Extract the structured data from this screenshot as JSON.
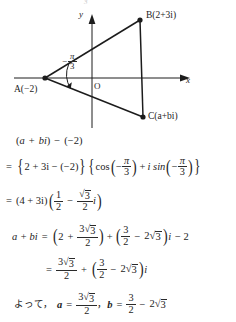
{
  "diagram": {
    "name": "complex-plane-triangle",
    "axes": {
      "x_label": "x",
      "y_label": "y",
      "origin_label": "O"
    },
    "top_artifact": "3",
    "points": [
      {
        "id": "A",
        "label": "A(−2)",
        "value": "−2",
        "x": 45,
        "y": 78
      },
      {
        "id": "B",
        "label": "B(2+3i)",
        "value": "2+3i",
        "x": 140,
        "y": 20
      },
      {
        "id": "C",
        "label": "C(a+bi)",
        "value": "a+bi",
        "x": 143,
        "y": 117
      }
    ],
    "angle": {
      "sign": "−",
      "numerator": "π",
      "denominator": "3",
      "text": "−π/3",
      "vertex": "A"
    },
    "line_color": "#1c1c1c"
  },
  "solution": {
    "line1": {
      "text": "(a + bi) − (−2)",
      "open": "(",
      "a": "a",
      "plus": "+",
      "b": "b",
      "i": "i",
      "close": ")",
      "minus": "−",
      "minus_two": "(−2)"
    },
    "line2": {
      "eq": "=",
      "brace_open": "{",
      "inner": "2 + 3i − (−2)",
      "brace_close": "}",
      "cos": "cos",
      "isin": "i sin",
      "sign": "−",
      "pi": "π",
      "three": "3",
      "plus": "+"
    },
    "line3": {
      "eq": "=",
      "factor": "(4 + 3i)",
      "half_num": "1",
      "half_den": "2",
      "minus": "−",
      "sqrt_num": "3",
      "sqrt_den": "2",
      "i": "i"
    },
    "line4": {
      "lhs": "a + bi",
      "eq": "=",
      "first_const": "2",
      "plus": "+",
      "frac1_num": "3√3",
      "frac1_den": "2",
      "frac2_num": "3",
      "frac2_den": "2",
      "minus": "−",
      "two_sqrt3": "2√3",
      "i": "i",
      "minus_two": "− 2"
    },
    "line5": {
      "eq": "=",
      "frac1_num": "3√3",
      "frac1_den": "2",
      "plus": "+",
      "frac2_num": "3",
      "frac2_den": "2",
      "minus": "−",
      "two_sqrt3": "2√3",
      "i": "i"
    },
    "line6": {
      "jp": "よって，",
      "a_var": "a",
      "eq": "=",
      "a_num": "3√3",
      "a_den": "2",
      "comma": "，",
      "b_var": "b",
      "b_num": "3",
      "b_den": "2",
      "minus": "−",
      "b_tail": "2√3"
    },
    "symbols": {
      "radical": "√",
      "three": "3",
      "two": "2",
      "pi": "π"
    }
  }
}
